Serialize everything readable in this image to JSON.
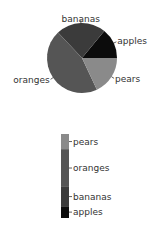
{
  "chart_data": [
    {
      "type": "pie",
      "title": "",
      "categories": [
        "apples",
        "bananas",
        "oranges",
        "pears"
      ],
      "values": [
        14,
        23,
        45,
        18
      ],
      "colors": [
        "#0c0c0c",
        "#3b3b3b",
        "#555555",
        "#8a8a8a"
      ],
      "start_angle_deg": 0,
      "direction": "counterclockwise"
    },
    {
      "type": "bar",
      "subtype": "stacked-legend-bar",
      "categories": [
        "apples",
        "bananas",
        "oranges",
        "pears"
      ],
      "values": [
        14,
        23,
        45,
        18
      ],
      "colors": [
        "#0c0c0c",
        "#3b3b3b",
        "#555555",
        "#8a8a8a"
      ],
      "order": "bottom-to-top"
    }
  ]
}
